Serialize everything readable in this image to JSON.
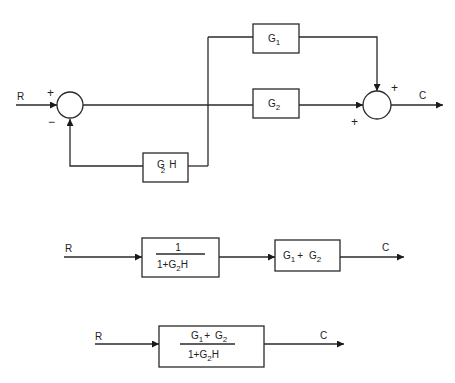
{
  "diagram": {
    "colors": {
      "stroke": "#2a2a2a",
      "background": "#ffffff"
    },
    "original": {
      "input_label": "R",
      "output_label": "C",
      "summing_junction_left": {
        "plus_sign": "+",
        "minus_sign": "−"
      },
      "summing_junction_right": {
        "top_sign": "+",
        "left_sign": "+"
      },
      "blocks": {
        "g1": {
          "base": "G",
          "sub": "1"
        },
        "g2": {
          "base": "G",
          "sub": "2"
        },
        "feedback": {
          "base": "G",
          "sub": "2",
          "suffix": "H"
        }
      }
    },
    "reduced_step": {
      "input_label": "R",
      "output_label": "C",
      "block1": {
        "numerator": "1",
        "denominator_prefix": "1+G",
        "denominator_sub": "2",
        "denominator_suffix": "H"
      },
      "block2": {
        "a": "G",
        "a_sub": "1",
        "plus": "+",
        "b": "G",
        "b_sub": "2"
      }
    },
    "final": {
      "input_label": "R",
      "output_label": "C",
      "block": {
        "num_a": "G",
        "num_a_sub": "1",
        "num_plus": "+",
        "num_b": "G",
        "num_b_sub": "2",
        "den_prefix": "1+G",
        "den_sub": "2",
        "den_suffix": "H"
      }
    }
  }
}
